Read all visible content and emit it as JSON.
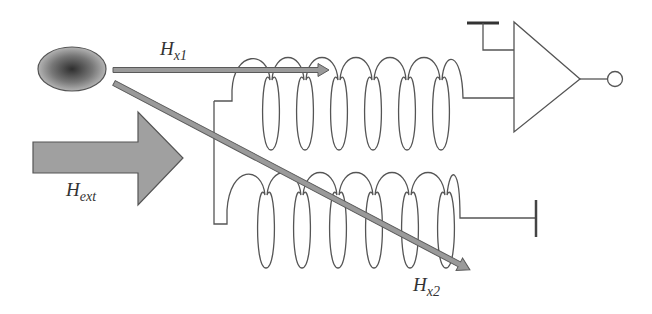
{
  "diagram": {
    "labels": {
      "hx1": {
        "main": "H",
        "sub": "x1"
      },
      "hx2": {
        "main": "H",
        "sub": "x2"
      },
      "hext": {
        "main": "H",
        "sub": "ext"
      }
    },
    "elements": [
      "magnetic-particle-ellipse",
      "field-arrow-hx1",
      "field-arrow-hx2",
      "external-field-arrow-hext",
      "upper-coil",
      "lower-coil",
      "amplifier-triangle",
      "output-terminal",
      "ground-bar-top",
      "ground-bar-right"
    ],
    "colors": {
      "line": "#555555",
      "arrow_fill": "#9a9a9a",
      "arrow_stroke": "#5a5a5a",
      "particle_center": "#3a3a3a",
      "particle_edge": "#b0b0b0"
    }
  }
}
